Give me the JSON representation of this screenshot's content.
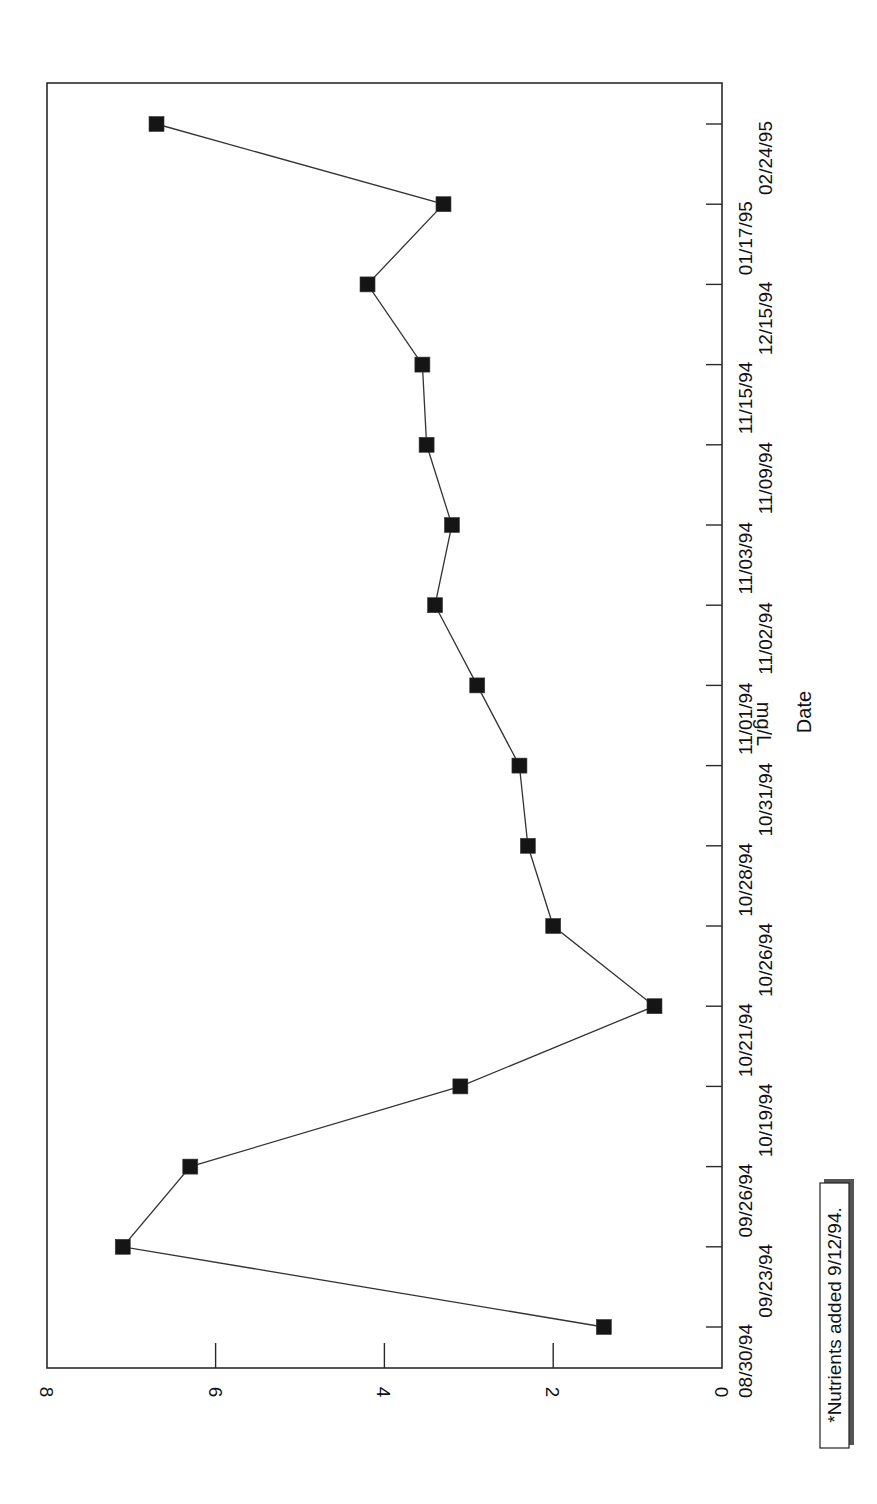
{
  "chart_data": {
    "type": "line",
    "orientation": "rotated 90 degrees clockwise on page (reads bottom-to-top)",
    "title": "",
    "xlabel": "Date",
    "ylabel": "mg/L",
    "ylim": [
      0,
      8
    ],
    "yticks": [
      0,
      2,
      4,
      6,
      8
    ],
    "grid": false,
    "legend": null,
    "marker": "filled-square",
    "categories": [
      "08/30/94",
      "09/23/94",
      "09/26/94",
      "10/19/94",
      "10/21/94",
      "10/26/94",
      "10/28/94",
      "10/31/94",
      "11/01/94",
      "11/02/94",
      "11/03/94",
      "11/09/94",
      "11/15/94",
      "12/15/94",
      "01/17/95",
      "02/24/95"
    ],
    "series": [
      {
        "name": "mg/L",
        "values": [
          1.4,
          7.1,
          6.3,
          3.1,
          0.8,
          2.0,
          2.3,
          2.4,
          2.9,
          3.4,
          3.2,
          3.5,
          3.55,
          4.2,
          3.3,
          6.7
        ]
      }
    ],
    "annotations": [
      {
        "text": "*Nutrients added 9/12/94.",
        "style": "boxed with drop shadow"
      }
    ]
  },
  "labels": {
    "xlabel": "Date",
    "ylabel": "mg/L",
    "note": "*Nutrients added 9/12/94."
  },
  "colors": {
    "line": "#333333",
    "marker": "#151515",
    "frame": "#2a2a2a",
    "background": "#ffffff"
  }
}
